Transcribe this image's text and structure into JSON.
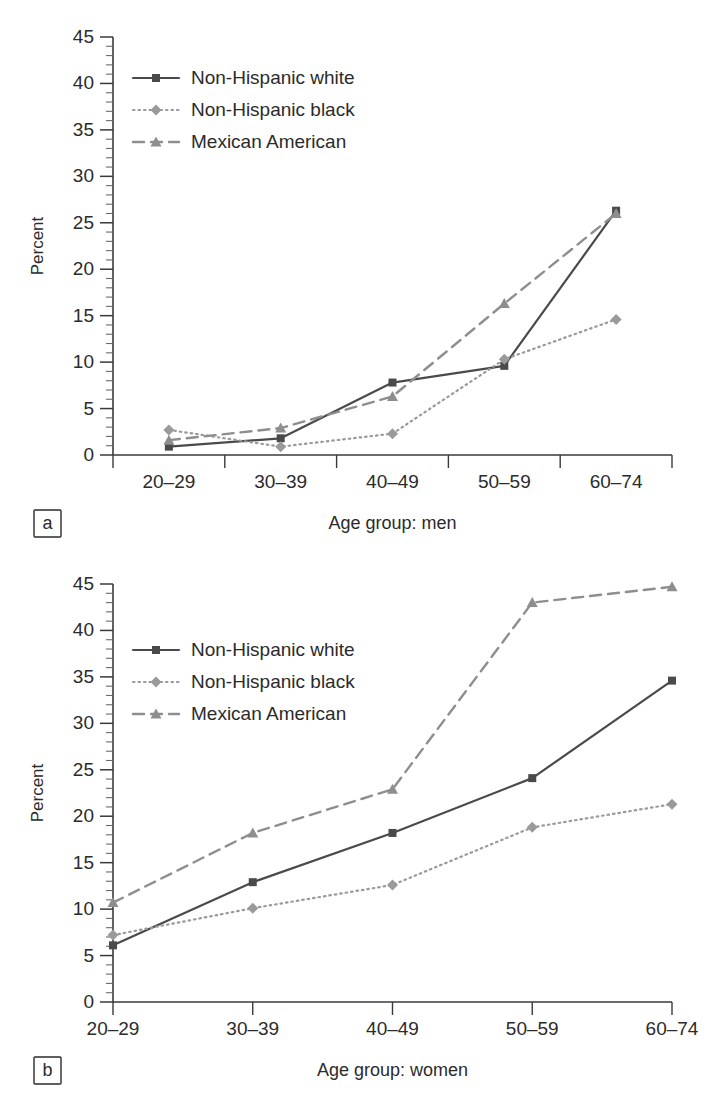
{
  "figure": {
    "panels": [
      "a",
      "b"
    ]
  },
  "axis": {
    "y_label": "Percent",
    "y_ticks": [
      "0",
      "5",
      "10",
      "15",
      "20",
      "25",
      "30",
      "35",
      "40",
      "45"
    ],
    "x_ticks": [
      "20–29",
      "30–39",
      "40–49",
      "50–59",
      "60–74"
    ]
  },
  "legend": {
    "entries": [
      {
        "label": "Non-Hispanic white",
        "style": "solid",
        "marker": "square",
        "color": "#4a4a4a"
      },
      {
        "label": "Non-Hispanic black",
        "style": "dotted",
        "marker": "diamond",
        "color": "#9a9a9a"
      },
      {
        "label": "Mexican American",
        "style": "dashed",
        "marker": "triangle",
        "color": "#8e8e8e"
      }
    ]
  },
  "panel_a": {
    "tag": "a",
    "x_title": "Age group: men"
  },
  "panel_b": {
    "tag": "b",
    "x_title": "Age group: women"
  },
  "chart_data": [
    {
      "type": "line",
      "panel": "a",
      "title": "",
      "xlabel": "Age group: men",
      "ylabel": "Percent",
      "categories": [
        "20–29",
        "30–39",
        "40–49",
        "50–59",
        "60–74"
      ],
      "ylim": [
        0,
        45
      ],
      "ytick_step": 5,
      "yminor_step": 1,
      "grid": false,
      "legend_position": "upper-left",
      "series": [
        {
          "name": "Non-Hispanic white",
          "values": [
            0.9,
            1.8,
            7.8,
            9.6,
            26.3
          ],
          "color": "#4a4a4a",
          "style": "solid",
          "marker": "square"
        },
        {
          "name": "Non-Hispanic black",
          "values": [
            2.7,
            0.9,
            2.3,
            10.3,
            14.6
          ],
          "color": "#9a9a9a",
          "style": "dotted",
          "marker": "diamond"
        },
        {
          "name": "Mexican American",
          "values": [
            1.6,
            2.9,
            6.3,
            16.3,
            26.0
          ],
          "color": "#8e8e8e",
          "style": "dashed",
          "marker": "triangle"
        }
      ]
    },
    {
      "type": "line",
      "panel": "b",
      "title": "",
      "xlabel": "Age group: women",
      "ylabel": "Percent",
      "categories": [
        "20–29",
        "30–39",
        "40–49",
        "50–59",
        "60–74"
      ],
      "ylim": [
        0,
        45
      ],
      "ytick_step": 5,
      "yminor_step": 1,
      "grid": false,
      "legend_position": "upper-left",
      "series": [
        {
          "name": "Non-Hispanic white",
          "values": [
            6.1,
            12.9,
            18.2,
            24.1,
            34.6
          ],
          "color": "#4a4a4a",
          "style": "solid",
          "marker": "square"
        },
        {
          "name": "Non-Hispanic black",
          "values": [
            7.2,
            10.1,
            12.6,
            18.8,
            21.3
          ],
          "color": "#9a9a9a",
          "style": "dotted",
          "marker": "diamond"
        },
        {
          "name": "Mexican American",
          "values": [
            10.7,
            18.2,
            22.9,
            43.0,
            44.7
          ],
          "color": "#8e8e8e",
          "style": "dashed",
          "marker": "triangle"
        }
      ]
    }
  ]
}
